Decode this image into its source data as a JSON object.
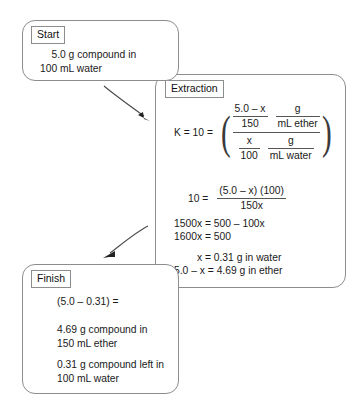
{
  "diagram": {
    "boxes": {
      "start": {
        "tag": "Start",
        "lines": [
          "    5.0 g compound in",
          "100 mL water"
        ],
        "text": "    5.0 g compound in\n100 mL water"
      },
      "extraction": {
        "tag": "Extraction",
        "equation_main": {
          "lhs": "K = 10 =",
          "numerator": {
            "quantity_num": "5.0 – x",
            "quantity_den": "150",
            "units_num": "g",
            "units_den": "mL ether"
          },
          "denominator": {
            "quantity_num": "x",
            "quantity_den": "100",
            "units_num": "g",
            "units_den": "mL water"
          }
        },
        "equation_two": {
          "lhs": "10 =",
          "numerator": "(5.0 – x) (100)",
          "denominator": "150x"
        },
        "steps_a": "1500x = 500 – 100x\n1600x = 500",
        "steps_b": "        x = 0.31 g in water\n5.0 – x = 4.69 g in ether"
      },
      "finish": {
        "tag": "Finish",
        "line1": "(5.0 – 0.31) =",
        "line2": "4.69 g compound in\n150 mL ether",
        "line3": "0.31 g compound left in\n100 mL water"
      }
    },
    "arrows": [
      {
        "name": "arrow-start-to-extraction",
        "direction": "down-right"
      },
      {
        "name": "arrow-extraction-to-finish",
        "direction": "down-left"
      }
    ],
    "colors": {
      "stroke": "#8d8d8d",
      "text": "#1a1a1a",
      "rule": "#555555",
      "background": "#ffffff"
    }
  }
}
